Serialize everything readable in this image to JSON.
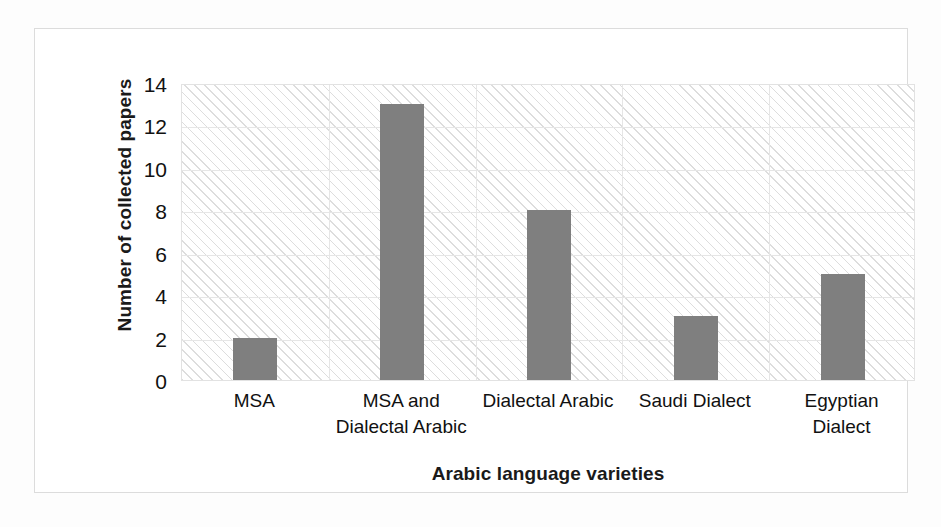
{
  "chart_data": {
    "type": "bar",
    "title": "",
    "xlabel": "Arabic language varieties",
    "ylabel": "Number of collected papers",
    "categories": [
      "MSA",
      "MSA and Dialectal Arabic",
      "Dialectal Arabic",
      "Saudi Dialect",
      "Egyptian Dialect"
    ],
    "category_lines": [
      [
        "MSA"
      ],
      [
        "MSA and",
        "Dialectal Arabic"
      ],
      [
        "Dialectal Arabic"
      ],
      [
        "Saudi Dialect"
      ],
      [
        "Egyptian",
        "Dialect"
      ]
    ],
    "values": [
      2,
      13,
      8,
      3,
      5
    ],
    "ylim": [
      0,
      14
    ],
    "ytick_values": [
      14,
      12,
      10,
      8,
      6,
      4,
      2,
      0
    ],
    "ytick_labels": [
      "14",
      "12",
      "10",
      "8",
      "6",
      "4",
      "2",
      "0"
    ],
    "grid": "horizontal-and-category-separators",
    "legend": "none",
    "bar_color": "#7f7f7f",
    "plot_background": "#ffffff",
    "plot_hatch_color": "#aaaaaa",
    "gridline_color": "#e6e6e6",
    "axis_text_color": "#111111",
    "frame_color": "#dcdcdc"
  }
}
